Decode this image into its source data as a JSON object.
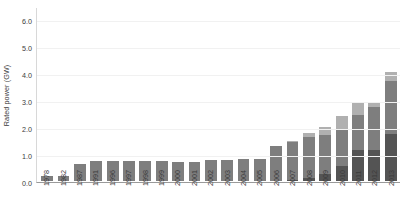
{
  "chart_data": {
    "type": "bar",
    "title": "",
    "xlabel": "",
    "ylabel": "Rated power (GW)",
    "ylim": [
      0.0,
      6.5
    ],
    "yticks": [
      "0.0",
      "1.0",
      "2.0",
      "3.0",
      "4.0",
      "5.0",
      "6.0"
    ],
    "ytick_values": [
      0.0,
      1.0,
      2.0,
      3.0,
      4.0,
      5.0,
      6.0
    ],
    "grid": false,
    "legend": "none",
    "stacked": true,
    "categories": [
      "1978",
      "1982",
      "1987",
      "1991",
      "1996",
      "1997",
      "1998",
      "1999",
      "2000",
      "2001",
      "2002",
      "2003",
      "2004",
      "2005",
      "2006",
      "2007",
      "2008",
      "2009",
      "2010",
      "2011",
      "2012",
      "2013"
    ],
    "series": [
      {
        "name": "bottom-segment",
        "color": "#545454",
        "values": [
          0.0,
          0.0,
          0.0,
          0.0,
          0.0,
          0.0,
          0.0,
          0.0,
          0.0,
          0.0,
          0.0,
          0.0,
          0.0,
          0.0,
          0.0,
          0.05,
          0.1,
          0.25,
          0.55,
          1.15,
          1.15,
          1.75
        ]
      },
      {
        "name": "middle-segment",
        "color": "#7e7e7e",
        "values": [
          0.2,
          0.2,
          0.65,
          0.75,
          0.75,
          0.75,
          0.75,
          0.75,
          0.72,
          0.72,
          0.78,
          0.78,
          0.8,
          0.8,
          1.3,
          1.4,
          1.55,
          1.45,
          1.35,
          1.3,
          1.6,
          1.95
        ]
      },
      {
        "name": "top-segment",
        "color": "#b0b0b0",
        "values": [
          0.0,
          0.0,
          0.0,
          0.0,
          0.0,
          0.0,
          0.0,
          0.0,
          0.0,
          0.0,
          0.0,
          0.0,
          0.0,
          0.0,
          0.0,
          0.05,
          0.15,
          0.3,
          0.5,
          0.45,
          0.2,
          0.35
        ]
      }
    ],
    "totals": [
      0.2,
      0.2,
      0.65,
      0.75,
      0.75,
      0.75,
      0.75,
      0.75,
      0.72,
      0.72,
      0.78,
      0.78,
      0.8,
      0.8,
      1.3,
      1.5,
      1.8,
      2.0,
      2.4,
      2.9,
      2.95,
      4.05
    ]
  }
}
